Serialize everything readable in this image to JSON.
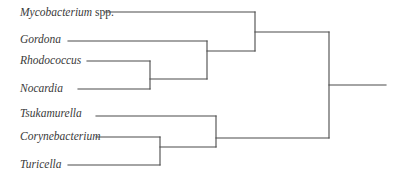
{
  "diagram": {
    "type": "dendrogram",
    "orientation": "leaves-left-root-right",
    "line_color": "#4a4a4a",
    "text_color": "#3a3a3a",
    "taxa": [
      {
        "id": "mycobacterium",
        "genus": "Mycobacterium",
        "suffix": " spp."
      },
      {
        "id": "gordona",
        "genus": "Gordona",
        "suffix": ""
      },
      {
        "id": "rhodococcus",
        "genus": "Rhodococcus",
        "suffix": ""
      },
      {
        "id": "nocardia",
        "genus": "Nocardia",
        "suffix": ""
      },
      {
        "id": "tsukamurella",
        "genus": "Tsukamurella",
        "suffix": ""
      },
      {
        "id": "corynebacterium",
        "genus": "Corynebacterium",
        "suffix": ""
      },
      {
        "id": "turicella",
        "genus": "Turicella",
        "suffix": ""
      }
    ],
    "topology": "(((Mycobacterium spp.,(Gordona,(Rhodococcus,Nocardia))),(Tsukamurella,(Corynebacterium,Turicella))));",
    "clades": [
      {
        "name": "rhodococcus-nocardia",
        "members": [
          "Rhodococcus",
          "Nocardia"
        ]
      },
      {
        "name": "gordona-rhodococcus-nocardia",
        "members": [
          "Gordona",
          "Rhodococcus",
          "Nocardia"
        ]
      },
      {
        "name": "mycobacterium-clade",
        "members": [
          "Mycobacterium spp.",
          "Gordona",
          "Rhodococcus",
          "Nocardia"
        ]
      },
      {
        "name": "corynebacterium-turicella",
        "members": [
          "Corynebacterium",
          "Turicella"
        ]
      },
      {
        "name": "tsukamurella-clade",
        "members": [
          "Tsukamurella",
          "Corynebacterium",
          "Turicella"
        ]
      },
      {
        "name": "root",
        "members": [
          "Mycobacterium spp.",
          "Gordona",
          "Rhodococcus",
          "Nocardia",
          "Tsukamurella",
          "Corynebacterium",
          "Turicella"
        ]
      }
    ]
  }
}
